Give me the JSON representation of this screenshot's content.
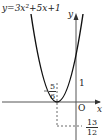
{
  "diagram": {
    "equation": "y=3x²+5x+1",
    "axis_x_label": "x",
    "axis_y_label": "y",
    "origin_label": "O",
    "y_intercept_label": "1",
    "vertex_x": {
      "sign": "−",
      "numerator": "5",
      "denominator": "6"
    },
    "vertex_y": {
      "sign": "−",
      "numerator": "13",
      "denominator": "12"
    },
    "colors": {
      "curve": "#111111",
      "axis": "#555555"
    }
  }
}
